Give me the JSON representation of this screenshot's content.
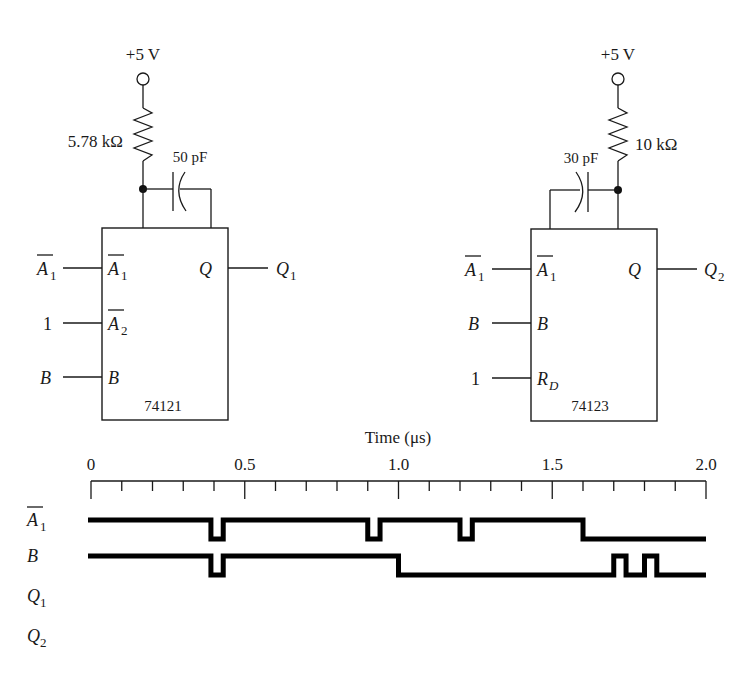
{
  "circuits": [
    {
      "chip": "74121",
      "supply": "+5 V",
      "resistor": "5.78 kΩ",
      "capacitor": "50 pF",
      "inputs": [
        {
          "external": "A",
          "ext_sub": "1",
          "ext_bar": true,
          "pin": "A",
          "pin_sub": "1",
          "pin_bar": true
        },
        {
          "external": "1",
          "ext_sub": "",
          "ext_bar": false,
          "pin": "A",
          "pin_sub": "2",
          "pin_bar": true
        },
        {
          "external": "B",
          "ext_sub": "",
          "ext_bar": false,
          "pin": "B",
          "pin_sub": "",
          "pin_bar": false
        }
      ],
      "output_pin": "Q",
      "output_label": "Q",
      "output_sub": "1"
    },
    {
      "chip": "74123",
      "supply": "+5 V",
      "resistor": "10 kΩ",
      "capacitor": "30 pF",
      "inputs": [
        {
          "external": "A",
          "ext_sub": "1",
          "ext_bar": true,
          "pin": "A",
          "pin_sub": "1",
          "pin_bar": true
        },
        {
          "external": "B",
          "ext_sub": "",
          "ext_bar": false,
          "pin": "B",
          "pin_sub": "",
          "pin_bar": false
        },
        {
          "external": "1",
          "ext_sub": "",
          "ext_bar": false,
          "pin": "R",
          "pin_sub": "D",
          "pin_bar": false
        }
      ],
      "output_pin": "Q",
      "output_label": "Q",
      "output_sub": "2"
    }
  ],
  "timing": {
    "axis_title": "Time (μs)",
    "axis_min": 0,
    "axis_max": 2.0,
    "major_ticks": [
      "0",
      "0.5",
      "1.0",
      "1.5",
      "2.0"
    ],
    "minor_step": 0.1,
    "signals": [
      {
        "name": "A",
        "sub": "1",
        "bar": true,
        "initial": 1,
        "transitions": [
          [
            0.39,
            0
          ],
          [
            0.43,
            1
          ],
          [
            0.9,
            0
          ],
          [
            0.94,
            1
          ],
          [
            1.2,
            0
          ],
          [
            1.24,
            1
          ],
          [
            1.6,
            0
          ]
        ]
      },
      {
        "name": "B",
        "sub": "",
        "bar": false,
        "initial": 1,
        "transitions": [
          [
            0.39,
            0
          ],
          [
            0.43,
            1
          ],
          [
            1.0,
            0
          ],
          [
            1.7,
            1
          ],
          [
            1.74,
            0
          ],
          [
            1.8,
            1
          ],
          [
            1.84,
            0
          ]
        ]
      },
      {
        "name": "Q",
        "sub": "1",
        "bar": false,
        "initial": null,
        "transitions": []
      },
      {
        "name": "Q",
        "sub": "2",
        "bar": false,
        "initial": null,
        "transitions": []
      }
    ]
  }
}
